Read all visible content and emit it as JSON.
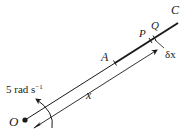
{
  "diagram": {
    "labels": {
      "origin": "O",
      "point_a": "A",
      "point_p": "P",
      "point_q": "Q",
      "end_c": "C",
      "delta_x": "δx",
      "distance_x": "x",
      "angular_speed_value": "5 rad s",
      "angular_speed_exp": "−1"
    },
    "colors": {
      "ink": "#1a1a1a",
      "background": "#ffffff"
    }
  }
}
